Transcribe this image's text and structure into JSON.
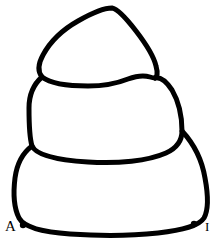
{
  "figure": {
    "title": "",
    "stroke_color": "#000000",
    "fill_color": "#ffffff",
    "background_color": "#ffffff",
    "stroke_width": 5,
    "width": 224,
    "height": 250
  },
  "annotations": {
    "left": {
      "label": "A",
      "point_x": 23,
      "point_y": 225,
      "dot_radius": 3.2
    },
    "right": {
      "label": "I",
      "point_x": 194,
      "point_y": 224,
      "dot_radius": 3.2
    }
  }
}
